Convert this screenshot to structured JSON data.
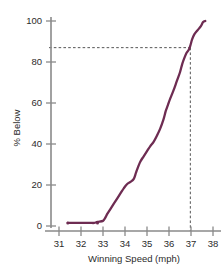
{
  "chart_data": {
    "type": "line",
    "title": "",
    "xlabel": "Winning Speed (mph)",
    "ylabel": "% Below",
    "xlim": [
      30.6,
      38.4
    ],
    "ylim": [
      0,
      100
    ],
    "xticks": [
      31,
      32,
      33,
      34,
      35,
      36,
      37,
      38
    ],
    "yticks": [
      0,
      20,
      40,
      60,
      80,
      100
    ],
    "xtick_labels": [
      "31",
      "32",
      "33",
      "34",
      "35",
      "36",
      "37",
      "38"
    ],
    "ytick_labels": [
      "0",
      "20",
      "40",
      "60",
      "80",
      "100"
    ],
    "grid": false,
    "legend": "none",
    "series": [
      {
        "name": "Cumulative percent below",
        "x": [
          31.4,
          31.9,
          32.1,
          32.3,
          32.45,
          32.6,
          32.75,
          33.0,
          33.1,
          33.2,
          33.35,
          33.5,
          33.65,
          33.8,
          33.95,
          34.1,
          34.25,
          34.4,
          34.5,
          34.6,
          34.7,
          34.85,
          35.0,
          35.15,
          35.3,
          35.45,
          35.6,
          35.75,
          35.85,
          35.95,
          36.05,
          36.2,
          36.35,
          36.5,
          36.6,
          36.7,
          36.8,
          36.9,
          36.97,
          37.05,
          37.15,
          37.3,
          37.45,
          37.55,
          37.65
        ],
        "y": [
          1.5,
          1.5,
          1.5,
          1.5,
          1.5,
          1.5,
          2.0,
          2.5,
          4.0,
          6.0,
          8.5,
          11.0,
          13.5,
          16.0,
          18.5,
          20.5,
          21.5,
          23.0,
          26.0,
          29.0,
          31.5,
          34.0,
          36.5,
          39.0,
          41.0,
          44.0,
          47.5,
          52.0,
          56.0,
          59.0,
          62.0,
          66.0,
          70.5,
          75.0,
          79.0,
          82.0,
          84.5,
          86.0,
          88.0,
          91.0,
          93.5,
          95.5,
          97.5,
          99.5,
          100.0
        ]
      }
    ],
    "markers": [
      {
        "x": 31.4,
        "y": 1.5
      },
      {
        "x": 32.75,
        "y": 1.5
      }
    ],
    "reference_lines": [
      {
        "orientation": "horizontal",
        "value": 87,
        "style": "dashed",
        "label": "87"
      },
      {
        "orientation": "vertical",
        "value": 36.97,
        "style": "dashed",
        "label": "37"
      }
    ],
    "series_color": "#6e2c52",
    "axis_color": "#8a8a8a",
    "reference_color": "#555555"
  },
  "ghost_header": ""
}
